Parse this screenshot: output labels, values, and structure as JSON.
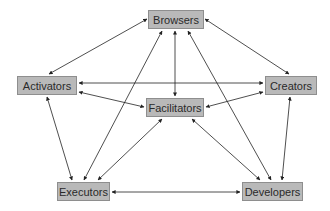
{
  "diagram": {
    "nodes": {
      "browsers": {
        "label": "Browsers",
        "x": 148,
        "y": 10,
        "w": 56,
        "h": 19
      },
      "activators": {
        "label": "Activators",
        "x": 17,
        "y": 76,
        "w": 60,
        "h": 19
      },
      "creators": {
        "label": "Creators",
        "x": 265,
        "y": 76,
        "w": 52,
        "h": 19
      },
      "facilitators": {
        "label": "Facilitators",
        "x": 146,
        "y": 98,
        "w": 58,
        "h": 19
      },
      "executors": {
        "label": "Executors",
        "x": 57,
        "y": 182,
        "w": 53,
        "h": 19
      },
      "developers": {
        "label": "Developers",
        "x": 242,
        "y": 182,
        "w": 61,
        "h": 19
      }
    },
    "edges": [
      {
        "from": "browsers",
        "to": "activators",
        "x1": 147,
        "y1": 19,
        "x2": 49,
        "y2": 74,
        "bidirectional": true
      },
      {
        "from": "browsers",
        "to": "creators",
        "x1": 205,
        "y1": 19,
        "x2": 289,
        "y2": 74,
        "bidirectional": true
      },
      {
        "from": "browsers",
        "to": "facilitators",
        "x1": 175,
        "y1": 31,
        "x2": 175,
        "y2": 96,
        "bidirectional": true
      },
      {
        "from": "browsers",
        "to": "executors",
        "x1": 162,
        "y1": 31,
        "x2": 84,
        "y2": 180,
        "bidirectional": true
      },
      {
        "from": "browsers",
        "to": "developers",
        "x1": 188,
        "y1": 31,
        "x2": 271,
        "y2": 180,
        "bidirectional": true
      },
      {
        "from": "activators",
        "to": "creators",
        "x1": 79,
        "y1": 83,
        "x2": 263,
        "y2": 83,
        "bidirectional": true
      },
      {
        "from": "activators",
        "to": "facilitators",
        "x1": 79,
        "y1": 92,
        "x2": 144,
        "y2": 107,
        "bidirectional": true
      },
      {
        "from": "creators",
        "to": "facilitators",
        "x1": 263,
        "y1": 92,
        "x2": 206,
        "y2": 107,
        "bidirectional": true
      },
      {
        "from": "activators",
        "to": "executors",
        "x1": 47,
        "y1": 97,
        "x2": 72,
        "y2": 180,
        "bidirectional": true
      },
      {
        "from": "creators",
        "to": "developers",
        "x1": 290,
        "y1": 97,
        "x2": 282,
        "y2": 180,
        "bidirectional": true
      },
      {
        "from": "facilitators",
        "to": "executors",
        "x1": 162,
        "y1": 119,
        "x2": 98,
        "y2": 180,
        "bidirectional": true
      },
      {
        "from": "facilitators",
        "to": "developers",
        "x1": 192,
        "y1": 119,
        "x2": 260,
        "y2": 180,
        "bidirectional": true
      },
      {
        "from": "executors",
        "to": "developers",
        "x1": 112,
        "y1": 192,
        "x2": 240,
        "y2": 192,
        "bidirectional": true
      }
    ],
    "colors": {
      "node_fill": "#b9b9b9",
      "node_border": "#8e8e8e",
      "edge": "#222222",
      "text": "#2a2a2a"
    }
  }
}
